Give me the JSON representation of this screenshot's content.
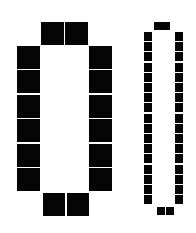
{
  "diagram": {
    "type": "seating-layout",
    "colors": {
      "background": "#ffffff",
      "seat": "#050505"
    },
    "tables": [
      {
        "name": "large-table",
        "seats_top": 2,
        "seats_bottom": 2,
        "seats_left": 6,
        "seats_right": 6,
        "total_seats": 16
      },
      {
        "name": "narrow-table",
        "seats_top": 2,
        "seats_bottom": 2,
        "seats_left": 17,
        "seats_right": 17,
        "total_seats": 38
      }
    ]
  }
}
